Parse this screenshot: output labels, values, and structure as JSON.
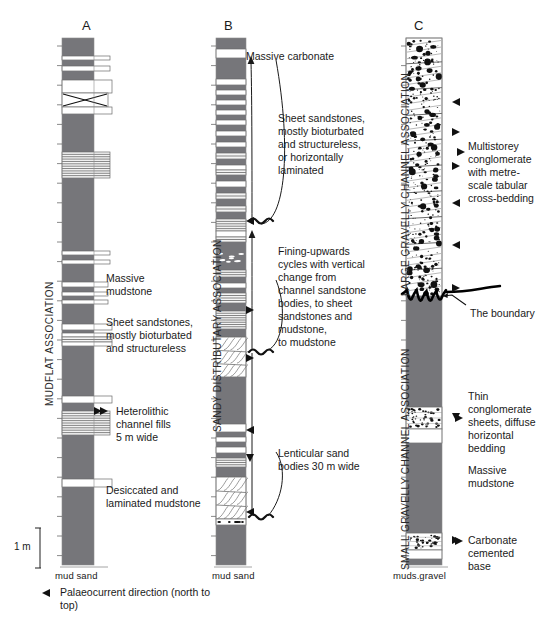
{
  "figure": {
    "title_columns": [
      {
        "id": "A",
        "label": "A",
        "x": 86,
        "y": 26
      },
      {
        "id": "B",
        "label": "B",
        "x": 228,
        "y": 26
      },
      {
        "id": "C",
        "label": "C",
        "x": 418,
        "y": 26
      }
    ]
  },
  "associations": [
    {
      "name": "MUDFLAT ASSOCIATION",
      "column": "A",
      "x": 44,
      "y_bottom": 406,
      "height": 178
    },
    {
      "name": "SANDY DISTRIBUTARY ASSOCIATION",
      "column": "B",
      "x": 212,
      "y_bottom": 432,
      "height": 230
    },
    {
      "name": "LARGE GRAVELLY CHANNEL ASSOCIATION",
      "column": "C",
      "x": 400,
      "y_bottom": 296,
      "height": 262
    },
    {
      "name": "SMALL GRAVELLY CHANNEL ASSOCIATION",
      "column": "C",
      "x": 400,
      "y_bottom": 570,
      "height": 262
    }
  ],
  "annotations": [
    {
      "key": "massive_carbonate",
      "text": "Massive carbonate",
      "x": 246,
      "y": 50
    },
    {
      "key": "sheet_sandstones_b",
      "text": "Sheet sandstones,\nmostly bioturbated\nand structureless,\nor horizontally\nlaminated",
      "x": 278,
      "y": 112
    },
    {
      "key": "fining_upwards",
      "text": "Fining-upwards\ncycles with vertical\nchange from\nchannel sandstone\nbodies, to sheet\nsandstones and\nmudstone,\nto mudstone",
      "x": 278,
      "y": 245
    },
    {
      "key": "lenticular_sand",
      "text": "Lenticular sand\nbodies 30 m wide",
      "x": 278,
      "y": 447
    },
    {
      "key": "massive_mudstone_a",
      "text": "Massive\nmudstone",
      "x": 106,
      "y": 272
    },
    {
      "key": "sheet_sandstones_a",
      "text": "Sheet sandstones,\nmostly bioturbated\nand structureless",
      "x": 106,
      "y": 316
    },
    {
      "key": "heterolithic",
      "text": "Heterolithic\nchannel fills\n5 m wide",
      "x": 106,
      "y": 405
    },
    {
      "key": "desiccated",
      "text": "Desiccated and\nlaminated mudstone",
      "x": 106,
      "y": 484
    },
    {
      "key": "multistorey",
      "text": "Multistorey\nconglomerate\nwith metre-\nscale tabular\ncross-bedding",
      "x": 468,
      "y": 140
    },
    {
      "key": "the_boundary",
      "text": "The boundary",
      "x": 470,
      "y": 307
    },
    {
      "key": "thin_conglomerate",
      "text": "Thin\nconglomerate\nsheets, diffuse\nhorizontal\nbedding",
      "x": 468,
      "y": 390
    },
    {
      "key": "massive_mudstone_c",
      "text": "Massive\nmudstone",
      "x": 468,
      "y": 464
    },
    {
      "key": "carbonate_base",
      "text": "Carbonate\ncemented\nbase",
      "x": 468,
      "y": 534
    }
  ],
  "axis_labels": [
    {
      "key": "axis-a",
      "text": "mud  sand",
      "x": 55,
      "y": 572
    },
    {
      "key": "axis-b",
      "text": "mud sand",
      "x": 214,
      "y": 572
    },
    {
      "key": "axis-c",
      "text": "muds.gravel",
      "x": 396,
      "y": 572
    }
  ],
  "scale": {
    "label": "1 m",
    "x": 16,
    "y": 543,
    "bar_x": 40,
    "bar_top": 528,
    "bar_bottom": 568
  },
  "legend": {
    "palaeocurrent_label": "Palaeocurrent direction (north to\ntop)",
    "marker_name": "palaeocurrent-arrow-icon",
    "x": 60,
    "y": 588,
    "marker_x": 46,
    "marker_y": 593
  },
  "colors": {
    "mudstone": "#76767a",
    "sandstone_fill": "#ffffff",
    "laminated_fill": "#e9e9e9",
    "outline": "#6a6a6a",
    "ink": "#1a1a1a",
    "conglomerate_clast": "#111111",
    "background": "#ffffff"
  },
  "columns": {
    "A": {
      "x": 62,
      "width": 32,
      "top": 38,
      "bottom": 565,
      "sand_extra_width": 16,
      "beds": [
        {
          "y": 38,
          "h": 18,
          "type": "mud",
          "w": 0
        },
        {
          "y": 56,
          "h": 4,
          "type": "sand_white",
          "w": 16
        },
        {
          "y": 60,
          "h": 6,
          "type": "mud",
          "w": 14
        },
        {
          "y": 66,
          "h": 5,
          "type": "sand_white",
          "w": 16
        },
        {
          "y": 71,
          "h": 9,
          "type": "mud",
          "w": 10
        },
        {
          "y": 80,
          "h": 13,
          "type": "sand_white",
          "w": 18
        },
        {
          "y": 93,
          "h": 14,
          "type": "crossbed_x",
          "w": 14
        },
        {
          "y": 107,
          "h": 7,
          "type": "sand_white",
          "w": 18
        },
        {
          "y": 114,
          "h": 38,
          "type": "mud",
          "w": 0
        },
        {
          "y": 152,
          "h": 26,
          "type": "laminated",
          "w": 16
        },
        {
          "y": 178,
          "h": 73,
          "type": "mud",
          "w": 0
        },
        {
          "y": 251,
          "h": 4,
          "type": "sand_white",
          "w": 16
        },
        {
          "y": 255,
          "h": 5,
          "type": "mud",
          "w": 0
        },
        {
          "y": 260,
          "h": 4,
          "type": "sand_white",
          "w": 16
        },
        {
          "y": 264,
          "h": 18,
          "type": "mud",
          "w": 0
        },
        {
          "y": 282,
          "h": 5,
          "type": "sand_white",
          "w": 14
        },
        {
          "y": 287,
          "h": 5,
          "type": "mud",
          "w": 0
        },
        {
          "y": 292,
          "h": 4,
          "type": "sand_white",
          "w": 14
        },
        {
          "y": 296,
          "h": 4,
          "type": "mud",
          "w": 0
        },
        {
          "y": 300,
          "h": 4,
          "type": "sand_white",
          "w": 14
        },
        {
          "y": 304,
          "h": 20,
          "type": "mud",
          "w": 0
        },
        {
          "y": 324,
          "h": 6,
          "type": "sand_white",
          "w": 18
        },
        {
          "y": 330,
          "h": 3,
          "type": "mud",
          "w": 0
        },
        {
          "y": 333,
          "h": 4,
          "type": "sand_white",
          "w": 18
        },
        {
          "y": 337,
          "h": 5,
          "type": "laminated",
          "w": 18
        },
        {
          "y": 342,
          "h": 4,
          "type": "sand_white",
          "w": 18
        },
        {
          "y": 346,
          "h": 50,
          "type": "mud",
          "w": 0
        },
        {
          "y": 396,
          "h": 7,
          "type": "sand_white",
          "w": 18
        },
        {
          "y": 403,
          "h": 8,
          "type": "mud",
          "w": 0
        },
        {
          "y": 411,
          "h": 24,
          "type": "laminated",
          "w": 16
        },
        {
          "y": 435,
          "h": 44,
          "type": "mud",
          "w": 0
        },
        {
          "y": 479,
          "h": 8,
          "type": "sand_white",
          "w": 18
        },
        {
          "y": 487,
          "h": 78,
          "type": "mud",
          "w": 0
        }
      ]
    },
    "B": {
      "x": 216,
      "width": 30,
      "top": 38,
      "bottom": 565,
      "beds": [
        {
          "y": 38,
          "h": 11,
          "type": "mud",
          "w": 0
        },
        {
          "y": 49,
          "h": 9,
          "type": "sand_white",
          "w": 0
        },
        {
          "y": 58,
          "h": 21,
          "type": "mud",
          "w": 0
        },
        {
          "y": 79,
          "h": 6,
          "type": "sand_white",
          "w": 0
        },
        {
          "y": 85,
          "h": 5,
          "type": "mud",
          "w": 0
        },
        {
          "y": 90,
          "h": 5,
          "type": "sand_white",
          "w": 0
        },
        {
          "y": 95,
          "h": 5,
          "type": "mud",
          "w": 0
        },
        {
          "y": 100,
          "h": 5,
          "type": "sand_white",
          "w": 0
        },
        {
          "y": 105,
          "h": 5,
          "type": "mud",
          "w": 0
        },
        {
          "y": 110,
          "h": 5,
          "type": "sand_white",
          "w": 0
        },
        {
          "y": 115,
          "h": 5,
          "type": "mud",
          "w": 0
        },
        {
          "y": 120,
          "h": 5,
          "type": "sand_white",
          "w": 0
        },
        {
          "y": 125,
          "h": 6,
          "type": "mud",
          "w": 0
        },
        {
          "y": 131,
          "h": 5,
          "type": "sand_white",
          "w": 0
        },
        {
          "y": 136,
          "h": 6,
          "type": "mud",
          "w": 0
        },
        {
          "y": 142,
          "h": 5,
          "type": "sand_white",
          "w": 0
        },
        {
          "y": 147,
          "h": 6,
          "type": "mud",
          "w": 0
        },
        {
          "y": 153,
          "h": 6,
          "type": "laminated",
          "w": 0
        },
        {
          "y": 159,
          "h": 6,
          "type": "mud",
          "w": 0
        },
        {
          "y": 165,
          "h": 5,
          "type": "sand_white",
          "w": 0
        },
        {
          "y": 170,
          "h": 5,
          "type": "laminated",
          "w": 0
        },
        {
          "y": 175,
          "h": 6,
          "type": "mud",
          "w": 0
        },
        {
          "y": 181,
          "h": 6,
          "type": "sand_white",
          "w": 0
        },
        {
          "y": 187,
          "h": 6,
          "type": "mud",
          "w": 0
        },
        {
          "y": 193,
          "h": 6,
          "type": "laminated",
          "w": 0
        },
        {
          "y": 199,
          "h": 7,
          "type": "mud",
          "w": 0
        },
        {
          "y": 206,
          "h": 6,
          "type": "laminated",
          "w": 0
        },
        {
          "y": 212,
          "h": 7,
          "type": "mud",
          "w": 0
        },
        {
          "y": 219,
          "h": 12,
          "type": "laminated",
          "w": 0
        },
        {
          "y": 231,
          "h": 6,
          "type": "sand_white",
          "w": 0
        },
        {
          "y": 237,
          "h": 5,
          "type": "laminated",
          "w": 0
        },
        {
          "y": 242,
          "h": 28,
          "type": "mud_clasts",
          "w": 0
        },
        {
          "y": 270,
          "h": 7,
          "type": "laminated",
          "w": 0
        },
        {
          "y": 277,
          "h": 6,
          "type": "mud",
          "w": 0
        },
        {
          "y": 283,
          "h": 5,
          "type": "sand_white",
          "w": 0
        },
        {
          "y": 288,
          "h": 5,
          "type": "mud",
          "w": 0
        },
        {
          "y": 293,
          "h": 10,
          "type": "laminated",
          "w": 0
        },
        {
          "y": 303,
          "h": 8,
          "type": "mud",
          "w": 0
        },
        {
          "y": 311,
          "h": 18,
          "type": "laminated",
          "w": 0
        },
        {
          "y": 329,
          "h": 8,
          "type": "mud",
          "w": 0
        },
        {
          "y": 337,
          "h": 40,
          "type": "crossbed",
          "w": 0
        },
        {
          "y": 377,
          "h": 47,
          "type": "mud",
          "w": 0
        },
        {
          "y": 424,
          "h": 8,
          "type": "sand_white",
          "w": 0
        },
        {
          "y": 432,
          "h": 5,
          "type": "mud",
          "w": 0
        },
        {
          "y": 437,
          "h": 5,
          "type": "sand_white",
          "w": 0
        },
        {
          "y": 442,
          "h": 5,
          "type": "mud",
          "w": 0
        },
        {
          "y": 447,
          "h": 6,
          "type": "sand_white",
          "w": 0
        },
        {
          "y": 453,
          "h": 5,
          "type": "mud",
          "w": 0
        },
        {
          "y": 458,
          "h": 9,
          "type": "laminated",
          "w": 0
        },
        {
          "y": 467,
          "h": 10,
          "type": "mud",
          "w": 0
        },
        {
          "y": 477,
          "h": 42,
          "type": "crossbed",
          "w": 0
        },
        {
          "y": 519,
          "h": 6,
          "type": "pebble_lag",
          "w": 0
        },
        {
          "y": 525,
          "h": 40,
          "type": "mud",
          "w": 0
        }
      ]
    },
    "C": {
      "x": 406,
      "width": 36,
      "top": 38,
      "bottom": 565,
      "boundary_y": 296,
      "beds": [
        {
          "y": 38,
          "h": 258,
          "type": "conglomerate",
          "w": 0
        },
        {
          "y": 296,
          "h": 111,
          "type": "mud",
          "w": 0
        },
        {
          "y": 407,
          "h": 22,
          "type": "conglomerate_sheet",
          "w": 0
        },
        {
          "y": 429,
          "h": 14,
          "type": "sand_white",
          "w": 0
        },
        {
          "y": 443,
          "h": 90,
          "type": "mud",
          "w": 0
        },
        {
          "y": 533,
          "h": 17,
          "type": "conglomerate_sheet",
          "w": 0
        },
        {
          "y": 550,
          "h": 9,
          "type": "sand_white",
          "w": 0
        },
        {
          "y": 559,
          "h": 6,
          "type": "mud",
          "w": 0
        }
      ]
    }
  },
  "palaeocurrent_markers": [
    {
      "col": "A",
      "x": 98,
      "y": 411,
      "dir": "right"
    },
    {
      "col": "B",
      "x": 250,
      "y": 221,
      "dir": "left"
    },
    {
      "col": "B",
      "x": 250,
      "y": 310,
      "dir": "right"
    },
    {
      "col": "B",
      "x": 250,
      "y": 358,
      "dir": "right"
    },
    {
      "col": "B",
      "x": 250,
      "y": 430,
      "dir": "left"
    },
    {
      "col": "B",
      "x": 250,
      "y": 458,
      "dir": "down"
    },
    {
      "col": "B",
      "x": 250,
      "y": 512,
      "dir": "left"
    },
    {
      "col": "C",
      "x": 456,
      "y": 102,
      "dir": "left"
    },
    {
      "col": "C",
      "x": 456,
      "y": 132,
      "dir": "right"
    },
    {
      "col": "C",
      "x": 456,
      "y": 166,
      "dir": "right"
    },
    {
      "col": "C",
      "x": 456,
      "y": 203,
      "dir": "left"
    },
    {
      "col": "C",
      "x": 456,
      "y": 245,
      "dir": "left"
    },
    {
      "col": "C",
      "x": 456,
      "y": 288,
      "dir": "right"
    },
    {
      "col": "C",
      "x": 456,
      "y": 417,
      "dir": "down"
    },
    {
      "col": "C",
      "x": 456,
      "y": 540,
      "dir": "right"
    }
  ]
}
